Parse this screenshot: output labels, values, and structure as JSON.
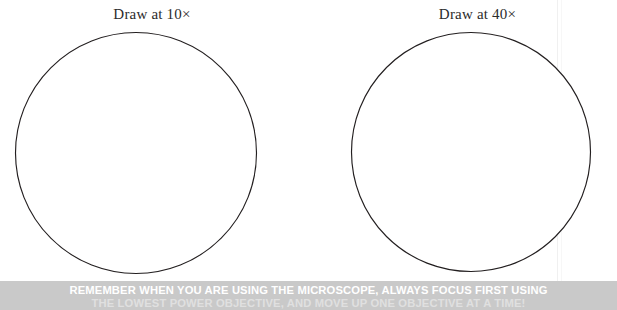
{
  "page": {
    "background_color": "#ffffff",
    "width": 617,
    "height": 310
  },
  "panels": [
    {
      "name": "draw-panel-10x",
      "label": "Draw at 10×",
      "magnification": "10×",
      "circle": {
        "center_x": 135,
        "center_y": 147,
        "radius": 121,
        "stroke_color": "#231f20",
        "fill_color": "#ffffff"
      }
    },
    {
      "name": "draw-panel-40x",
      "label": "Draw at 40×",
      "magnification": "40×",
      "circle": {
        "center_x": 470,
        "center_y": 147,
        "radius": 120,
        "stroke_color": "#231f20",
        "fill_color": "#ffffff"
      }
    }
  ],
  "reminder_banner": {
    "background_color": "#c9c9c9",
    "text_color": "#ffffff",
    "line_one": "REMEMBER WHEN YOU ARE USING THE MICROSCOPE, ALWAYS FOCUS FIRST USING",
    "line_two": "THE LOWEST POWER OBJECTIVE, AND MOVE UP ONE OBJECTIVE AT A TIME!"
  }
}
